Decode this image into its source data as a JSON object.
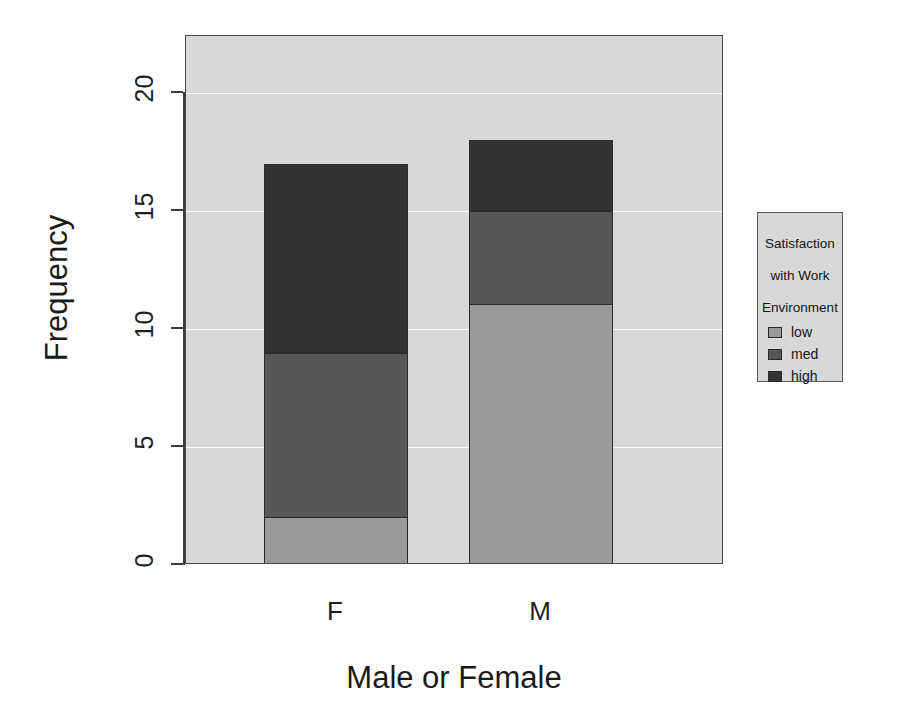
{
  "chart_data": {
    "type": "bar",
    "subtype": "stacked",
    "title": "",
    "xlabel": "Male or Female",
    "ylabel": "Frequency",
    "categories": [
      "F",
      "M"
    ],
    "series": [
      {
        "name": "low",
        "values": [
          2,
          11
        ],
        "color": "#9a9a9a"
      },
      {
        "name": "med",
        "values": [
          7,
          4
        ],
        "color": "#575757"
      },
      {
        "name": "high",
        "values": [
          8,
          3
        ],
        "color": "#333333"
      }
    ],
    "totals": [
      17,
      18
    ],
    "ylim": [
      0,
      22.4
    ],
    "yticks": [
      0,
      5,
      10,
      15,
      20
    ],
    "ytick_labels": [
      "0",
      "5",
      "10",
      "15",
      "20"
    ],
    "grid": true,
    "gridline_color": "#fdfdfd",
    "panel_background": "#d8d8d8",
    "legend_position": "right",
    "legend_title": "Satisfaction\nwith Work\nEnvironment",
    "legend_entries": [
      "low",
      "med",
      "high"
    ]
  },
  "axes": {
    "y_title": "Frequency",
    "x_title": "Male or Female",
    "y_tick_labels": [
      "0",
      "5",
      "10",
      "15",
      "20"
    ],
    "x_tick_labels": [
      "F",
      "M"
    ]
  },
  "legend": {
    "title_line_1": "Satisfaction",
    "title_line_2": "with Work",
    "title_line_3": "Environment",
    "items": [
      {
        "label": "low",
        "color": "#9a9a9a"
      },
      {
        "label": "med",
        "color": "#575757"
      },
      {
        "label": "high",
        "color": "#333333"
      }
    ]
  }
}
